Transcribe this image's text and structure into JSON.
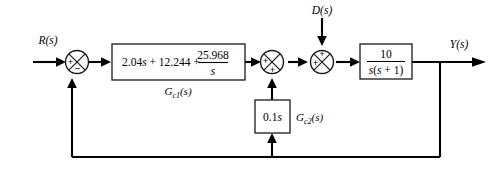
{
  "diagram": {
    "signals": {
      "reference": "R(s)",
      "disturbance": "D(s)",
      "output": "Y(s)"
    },
    "blocks": [
      {
        "id": "controller",
        "name": "controller-block",
        "label": "G_c1(s)",
        "label_base": "G",
        "label_sub": "c1",
        "label_tail": "(s)",
        "expr_prefix": "2.04",
        "expr_var1": "s",
        "expr_mid": " + 12.244 + ",
        "frac_num": "25.968",
        "frac_den": "s"
      },
      {
        "id": "rate-feedback",
        "name": "rate-feedback-block",
        "label_base": "G",
        "label_sub": "c2",
        "label_tail": "(s)",
        "expr_num": "0.1",
        "expr_var": "s"
      },
      {
        "id": "plant",
        "name": "plant-block",
        "frac_num": "10",
        "frac_den_pre": "s",
        "frac_den_mid": "(",
        "frac_den_var": "s",
        "frac_den_post": " + 1)"
      }
    ],
    "summers": [
      {
        "id": "summer-1",
        "name": "error-summing-junction",
        "sign_left": "+",
        "sign_bottom": "−"
      },
      {
        "id": "summer-2",
        "name": "rate-feedback-summing-junction",
        "sign_left": "+",
        "sign_bottom": "+"
      },
      {
        "id": "summer-3",
        "name": "disturbance-summing-junction",
        "sign_left": "+",
        "sign_top": "+"
      }
    ],
    "colors": {
      "line": "#000000",
      "box_stroke": "#1a1a1a",
      "background": "#ffffff"
    }
  }
}
